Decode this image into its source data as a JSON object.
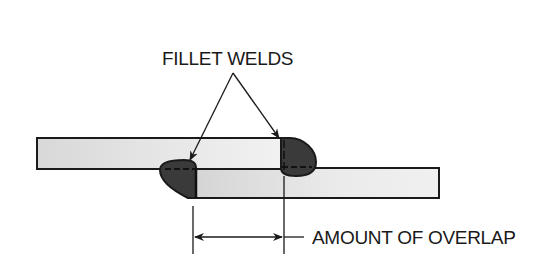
{
  "diagram": {
    "labels": {
      "fillet_welds": "FILLET WELDS",
      "overlap": "AMOUNT OF OVERLAP"
    },
    "components": [
      {
        "name": "top-plate",
        "x": 37,
        "y": 138,
        "width": 250,
        "height": 31
      },
      {
        "name": "bottom-plate",
        "x": 190,
        "y": 168,
        "width": 249,
        "height": 30
      },
      {
        "name": "fillet-weld-left",
        "position": "inner corner near left end of bottom plate"
      },
      {
        "name": "fillet-weld-right",
        "position": "outer corner at right end of top plate"
      }
    ],
    "colors": {
      "plate_fill": "#e2e2e2",
      "weld_fill": "#3a3a3a",
      "line": "#1a1a1a",
      "background": "#ffffff"
    }
  }
}
